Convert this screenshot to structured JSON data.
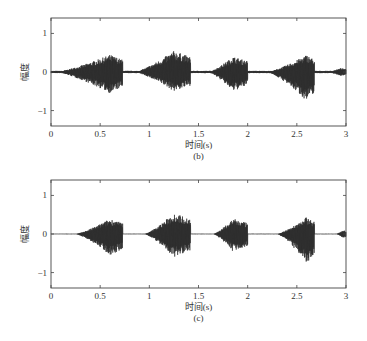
{
  "chart_data": [
    {
      "type": "line",
      "panel": "(b)",
      "title": "",
      "xlabel": "时间(s)",
      "ylabel": "幅度",
      "caption": "(b)",
      "xlim": [
        0,
        3
      ],
      "ylim": [
        -1.4,
        1.4
      ],
      "xticks": [
        "0",
        "0.5",
        "1",
        "1.5",
        "2",
        "2.5",
        "3"
      ],
      "yticks": [
        "1",
        "0",
        "−1"
      ],
      "grid": false,
      "series": [
        {
          "name": "waveform",
          "description": "speech-like audio waveform with 5 bursts",
          "bursts": [
            {
              "start": 0.05,
              "peak_t": 0.6,
              "end": 0.73,
              "amp_pos": 0.45,
              "amp_neg": -0.55
            },
            {
              "start": 0.85,
              "peak_t": 1.25,
              "end": 1.42,
              "amp_pos": 0.55,
              "amp_neg": -0.5
            },
            {
              "start": 1.6,
              "peak_t": 1.85,
              "end": 2.0,
              "amp_pos": 0.4,
              "amp_neg": -0.5
            },
            {
              "start": 2.2,
              "peak_t": 2.6,
              "end": 2.68,
              "amp_pos": 0.45,
              "amp_neg": -0.75
            },
            {
              "start": 2.8,
              "peak_t": 2.95,
              "end": 3.0,
              "amp_pos": 0.1,
              "amp_neg": -0.1
            }
          ]
        }
      ]
    },
    {
      "type": "line",
      "panel": "(c)",
      "title": "",
      "xlabel": "时间(s)",
      "ylabel": "幅度",
      "caption": "(c)",
      "xlim": [
        0,
        3
      ],
      "ylim": [
        -1.4,
        1.4
      ],
      "xticks": [
        "0",
        "0.5",
        "1",
        "1.5",
        "2",
        "2.5",
        "3"
      ],
      "yticks": [
        "1",
        "0",
        "−1"
      ],
      "grid": false,
      "series": [
        {
          "name": "waveform",
          "description": "denoised audio waveform with 5 bursts, flat silence",
          "bursts": [
            {
              "start": 0.25,
              "peak_t": 0.6,
              "end": 0.73,
              "amp_pos": 0.4,
              "amp_neg": -0.55
            },
            {
              "start": 0.95,
              "peak_t": 1.25,
              "end": 1.42,
              "amp_pos": 0.55,
              "amp_neg": -0.6
            },
            {
              "start": 1.65,
              "peak_t": 1.85,
              "end": 2.0,
              "amp_pos": 0.4,
              "amp_neg": -0.45
            },
            {
              "start": 2.3,
              "peak_t": 2.6,
              "end": 2.68,
              "amp_pos": 0.45,
              "amp_neg": -0.75
            },
            {
              "start": 2.9,
              "peak_t": 2.97,
              "end": 3.0,
              "amp_pos": 0.1,
              "amp_neg": -0.1
            }
          ]
        }
      ]
    }
  ],
  "panels": [
    {
      "ylabel": "幅度",
      "xlabel": "时间(s)",
      "caption": "(b)",
      "xticks": [
        "0",
        "0.5",
        "1",
        "1.5",
        "2",
        "2.5",
        "3"
      ],
      "yticks": [
        "1",
        "0",
        "−1"
      ]
    },
    {
      "ylabel": "幅度",
      "xlabel": "时间(s)",
      "caption": "(c)",
      "xticks": [
        "0",
        "0.5",
        "1",
        "1.5",
        "2",
        "2.5",
        "3"
      ],
      "yticks": [
        "1",
        "0",
        "−1"
      ]
    }
  ]
}
